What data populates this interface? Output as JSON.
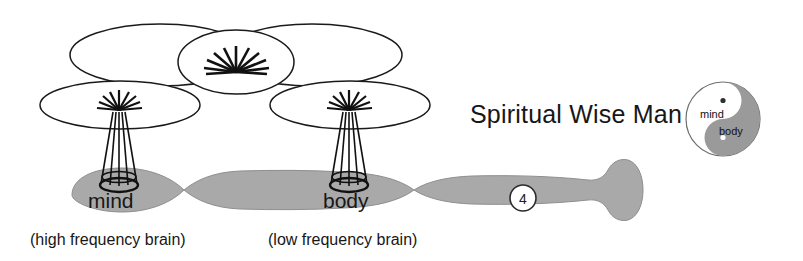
{
  "figure": {
    "kind": "conceptual-diagram",
    "background_color": "#ffffff",
    "ink_color": "#171717",
    "fill_gray": "#a9a9a9",
    "title": "Spiritual Wise Man",
    "labels": {
      "mind": "mind",
      "body": "body",
      "caption_left": "(high frequency brain)",
      "caption_right": "(low frequency brain)",
      "step_badge": "4"
    },
    "yin_yang": {
      "light_label": "mind",
      "dark_label": "body",
      "light_color": "#ffffff",
      "dark_color": "#9a9a9a",
      "outline_color": "#6e6e6e"
    },
    "icons": {
      "sunburst_center": "sunburst-icon",
      "sunburst_mind": "sunburst-icon",
      "sunburst_body": "sunburst-icon",
      "cone_mind": "cone-antenna-icon",
      "cone_body": "cone-antenna-icon",
      "taiji": "yin-yang-icon",
      "tail": "fish-tail-icon"
    },
    "counts": {
      "upper_ellipses": 2,
      "middle_ellipses": 1,
      "lower_ellipses": 2,
      "body_segments": 3
    }
  }
}
